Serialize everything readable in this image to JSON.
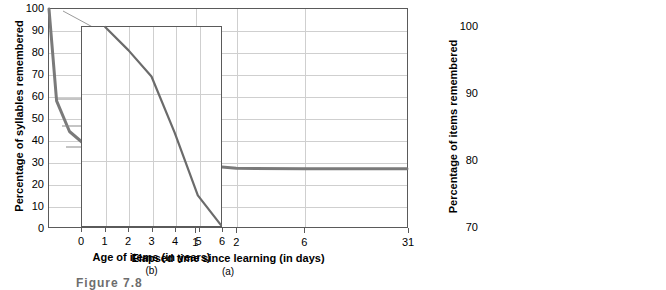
{
  "figure": {
    "caption": "Figure 7.8"
  },
  "chart_data": [
    {
      "type": "line",
      "id": "a",
      "panel_letter": "(a)",
      "title": "",
      "xlabel": "Elapsed time since learning (in days)",
      "ylabel": "Percentage of syllables remembered",
      "xlim": [
        0,
        31
      ],
      "ylim": [
        0,
        100
      ],
      "grid": true,
      "legend": "none",
      "xticks": [
        {
          "value": 1,
          "label": "1"
        },
        {
          "value": 2,
          "label": "2"
        },
        {
          "value": 6,
          "label": "6"
        },
        {
          "value": 31,
          "label": "31"
        }
      ],
      "yticks": [
        {
          "value": 0,
          "label": "0"
        },
        {
          "value": 10,
          "label": "10"
        },
        {
          "value": 20,
          "label": "20"
        },
        {
          "value": 30,
          "label": "30"
        },
        {
          "value": 40,
          "label": "40"
        },
        {
          "value": 50,
          "label": "50"
        },
        {
          "value": 60,
          "label": "60"
        },
        {
          "value": 70,
          "label": "70"
        },
        {
          "value": 80,
          "label": "80"
        },
        {
          "value": 90,
          "label": "90"
        },
        {
          "value": 100,
          "label": "100"
        }
      ],
      "x": [
        0,
        0.014,
        0.042,
        0.1,
        0.3,
        0.6,
        1.0,
        2.0,
        6.0,
        31.0
      ],
      "values": [
        100,
        58,
        44,
        36,
        32.5,
        30,
        28.8,
        27.2,
        27.0,
        27.0
      ],
      "annotations": [
        {
          "label": "Immediate recall",
          "x": 0,
          "y": 100
        },
        {
          "label": "20 minutes",
          "x": 0.014,
          "y": 58
        },
        {
          "label": "1 hour",
          "x": 0.042,
          "y": 44
        },
        {
          "label": "9 hours",
          "x": 0.375,
          "y": 36
        }
      ],
      "line_color": "#7a7a7a"
    },
    {
      "type": "line",
      "id": "b",
      "panel_letter": "(b)",
      "title": "",
      "xlabel": "Age of items (in years)",
      "ylabel": "Percentage of items remembered",
      "xlim": [
        0,
        6
      ],
      "ylim": [
        70,
        100
      ],
      "grid": true,
      "legend": "none",
      "xticks": [
        {
          "value": 0,
          "label": "0"
        },
        {
          "value": 1,
          "label": "1"
        },
        {
          "value": 2,
          "label": "2"
        },
        {
          "value": 3,
          "label": "3"
        },
        {
          "value": 4,
          "label": "4"
        },
        {
          "value": 5,
          "label": "5"
        },
        {
          "value": 6,
          "label": "6"
        }
      ],
      "yticks": [
        {
          "value": 70,
          "label": "70"
        },
        {
          "value": 80,
          "label": "80"
        },
        {
          "value": 90,
          "label": "90"
        },
        {
          "value": 100,
          "label": "100"
        }
      ],
      "x": [
        1,
        2,
        3,
        4,
        5,
        6
      ],
      "values": [
        100,
        96.5,
        92.5,
        84,
        74.5,
        70
      ],
      "annotations": [],
      "line_color": "#6b6b6b"
    }
  ]
}
